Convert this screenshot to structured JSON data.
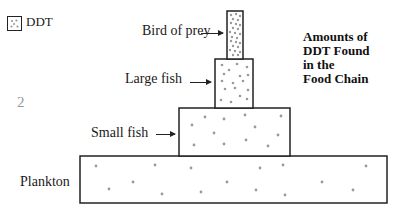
{
  "legend": {
    "label": "DDT",
    "icon": "dotted-square-icon"
  },
  "page_number": "2",
  "title": {
    "lines": [
      "Amounts of",
      "DDT Found",
      "in the",
      "Food Chain"
    ]
  },
  "levels": [
    {
      "label": "Bird of prey",
      "density": "very high"
    },
    {
      "label": "Large fish",
      "density": "high"
    },
    {
      "label": "Small fish",
      "density": "medium"
    },
    {
      "label": "Plankton",
      "density": "low"
    }
  ],
  "colors": {
    "outline": "#222222",
    "dot": "#9a9a9a",
    "page_number": "#999999"
  }
}
